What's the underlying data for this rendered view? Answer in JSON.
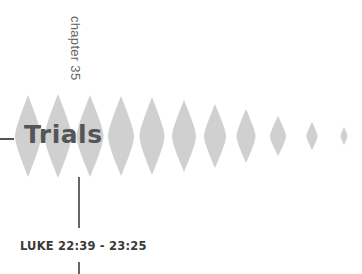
{
  "chapter": {
    "label": "chapter 35"
  },
  "title": "Trials",
  "reference": "LUKE 22:39 - 23:25",
  "decoration": {
    "spindle_color": "#c8c8c8",
    "spindles": [
      {
        "cx": 28,
        "h": 82,
        "w": 26
      },
      {
        "cx": 58,
        "h": 84,
        "w": 27
      },
      {
        "cx": 90,
        "h": 82,
        "w": 27
      },
      {
        "cx": 121,
        "h": 80,
        "w": 26
      },
      {
        "cx": 152,
        "h": 78,
        "w": 25
      },
      {
        "cx": 184,
        "h": 72,
        "w": 24
      },
      {
        "cx": 215,
        "h": 64,
        "w": 22
      },
      {
        "cx": 246,
        "h": 54,
        "w": 19
      },
      {
        "cx": 278,
        "h": 40,
        "w": 16
      },
      {
        "cx": 312,
        "h": 28,
        "w": 11
      },
      {
        "cx": 344,
        "h": 18,
        "w": 7
      }
    ]
  }
}
